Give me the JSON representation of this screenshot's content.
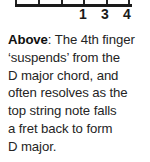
{
  "chord_diagram": {
    "name": "chord-box-bottom-crop",
    "string_count": 6,
    "finger_numbers": [
      {
        "label": "1",
        "string": 4
      },
      {
        "label": "3",
        "string": 5
      },
      {
        "label": "4",
        "string": 6
      }
    ]
  },
  "caption": {
    "lead_in": "Above",
    "lead_in_separator": ":",
    "lines": [
      " The 4th finger",
      "‘suspends’ from the",
      "D major chord, and",
      "often resolves as the",
      "top string note falls",
      "a fret back to form",
      "D major."
    ],
    "full_text": "Above: The 4th finger ‘suspends’ from the D major chord, and often resolves as the top string note falls a fret back to form D major."
  },
  "colors": {
    "background": "#ffffff",
    "text": "#242424",
    "diagram_line": "#1a1a1a"
  }
}
